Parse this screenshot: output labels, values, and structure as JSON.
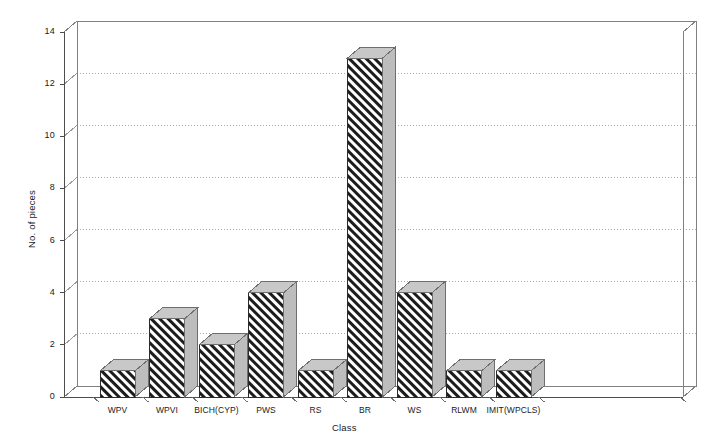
{
  "chart_data": {
    "type": "bar",
    "title": "",
    "subtitle": "",
    "xlabel": "Class",
    "ylabel": "No. of pieces",
    "categories": [
      "WPV",
      "WPVI",
      "BICH(CYP)",
      "PWS",
      "RS",
      "BR",
      "WS",
      "RLWM",
      "IMIT(WPCLS)"
    ],
    "values": [
      1,
      3,
      2,
      4,
      1,
      13,
      4,
      1,
      1
    ],
    "ylim": [
      0,
      14
    ],
    "ytick_values": [
      0,
      2,
      4,
      6,
      8,
      10,
      12,
      14
    ],
    "ytick_labels": [
      "0",
      "2",
      "4",
      "6",
      "8",
      "10",
      "12",
      "14"
    ],
    "grid": true,
    "grid_style": "dotted",
    "legend": false,
    "legend_position": "none",
    "style": "3d-bars-hatched",
    "bar_fill": "#000000",
    "bar_hatch": "diagonal-45",
    "bar_side_color": "#bdbdbd",
    "bar_top_color": "#c8c8c8",
    "axis_color": "#808080",
    "text_color": "#1a1a1a",
    "background": "#ffffff"
  }
}
